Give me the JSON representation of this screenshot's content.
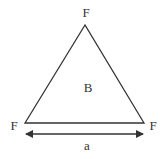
{
  "diagram": {
    "type": "equilateral-triangle",
    "vertices": {
      "top": {
        "label": "F"
      },
      "bottom_left": {
        "label": "F"
      },
      "bottom_right": {
        "label": "F"
      }
    },
    "center_label": "B",
    "side_dimension_label": "a",
    "colors": {
      "stroke": "#333333",
      "background": "#ffffff"
    }
  }
}
